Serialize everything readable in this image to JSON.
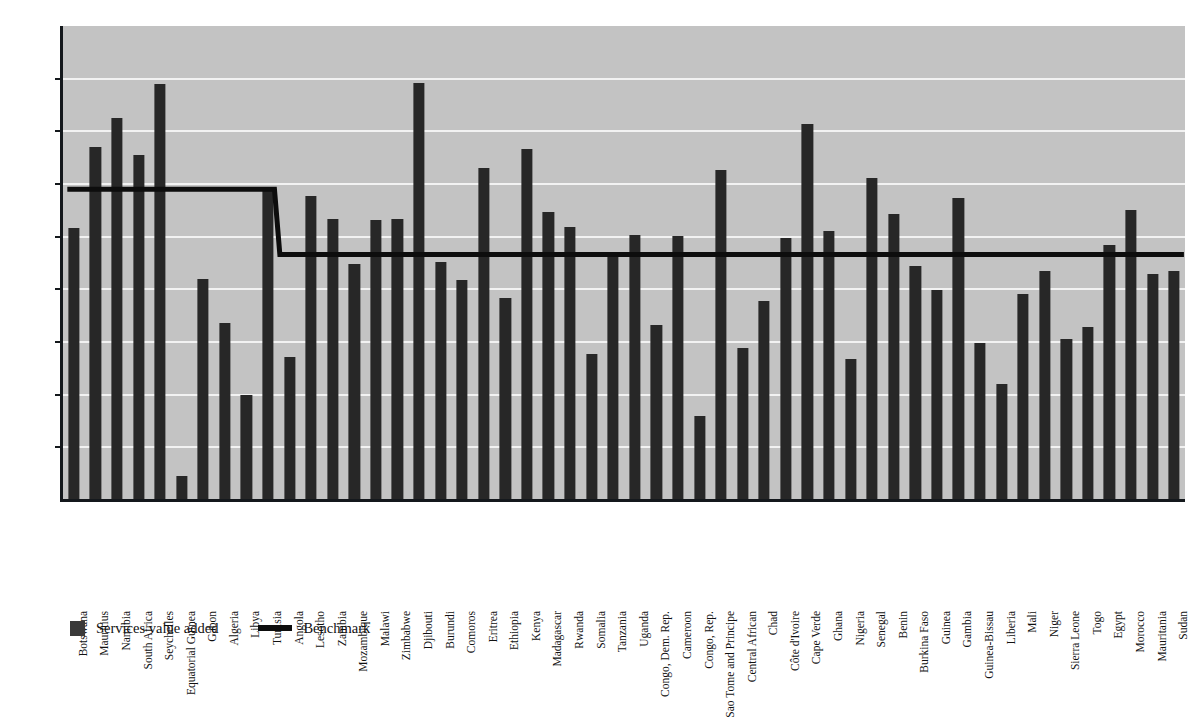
{
  "chart_data": {
    "type": "bar",
    "title": "",
    "subtitle": "",
    "xlabel": "",
    "ylabel": "",
    "ylim": [
      0,
      90
    ],
    "ytick_step": 10,
    "yticks": [
      0,
      10,
      20,
      30,
      40,
      50,
      60,
      70,
      80,
      90
    ],
    "grid": true,
    "legend_position": "bottom-left",
    "categories": [
      "Botswana",
      "Mauritius",
      "Namibia",
      "South Africa",
      "Seychelles",
      "Equatorial Guinea",
      "Gabon",
      "Algeria",
      "Libya",
      "Tunisia",
      "Angola",
      "Lesotho",
      "Zambia",
      "Mozambique",
      "Malawi",
      "Zimbabwe",
      "Djibouti",
      "Burundi",
      "Comoros",
      "Eritrea",
      "Ethiopia",
      "Kenya",
      "Madagascar",
      "Rwanda",
      "Somalia",
      "Tanzania",
      "Uganda",
      "Congo, Dem. Rep.",
      "Cameroon",
      "Congo, Rep.",
      "Sao Tome and Principe",
      "Central African",
      "Chad",
      "Côte d'Ivoire",
      "Cape Verde",
      "Ghana",
      "Nigeria",
      "Senegal",
      "Benin",
      "Burkina Faso",
      "Guinea",
      "Gambia",
      "Guinea-Bissau",
      "Liberia",
      "Mali",
      "Niger",
      "Sierra Leone",
      "Togo",
      "Egypt",
      "Morocco",
      "Mauritania",
      "Sudan"
    ],
    "series": [
      {
        "name": "Services value added",
        "type": "bar",
        "color": "#272727",
        "values": [
          51.6,
          67.0,
          72.6,
          65.5,
          79.0,
          4.5,
          42.0,
          33.7,
          19.9,
          59.0,
          27.2,
          57.7,
          53.4,
          44.8,
          53.2,
          53.3,
          79.2,
          45.2,
          41.7,
          63.0,
          38.3,
          66.7,
          54.7,
          51.8,
          27.8,
          47.0,
          50.4,
          33.2,
          50.1,
          16.0,
          62.6,
          28.9,
          37.7,
          49.8,
          71.4,
          51.0,
          26.8,
          61.1,
          54.3,
          44.5,
          39.8,
          57.4,
          29.8,
          22.1,
          39.2,
          43.4,
          30.5,
          32.8,
          48.5,
          55.1,
          43.0,
          43.4
        ]
      },
      {
        "name": "Benchmark",
        "type": "step-line",
        "color": "#0d0d0d",
        "segments": [
          {
            "from_category": "Botswana",
            "to_category": "Tunisia",
            "value": 59.0
          },
          {
            "from_category": "Angola",
            "to_category": "Sudan",
            "value": 46.6
          }
        ]
      }
    ]
  },
  "legend": {
    "items": [
      {
        "label": "Services value added",
        "marker": "square-swatch",
        "color": "#3a3a3a"
      },
      {
        "label": "Benchmark",
        "marker": "line-swatch",
        "color": "#0d0d0d"
      }
    ]
  },
  "axes": {
    "y": {
      "ticks": [
        "0",
        "10",
        "20",
        "30",
        "40",
        "50",
        "60",
        "70",
        "80",
        "90"
      ]
    }
  },
  "colors": {
    "plot_background": "#c3c3c3",
    "page_background": "#ffffff",
    "gridline": "#f2f2f2",
    "axis": "#14181c",
    "bar": "#272727",
    "benchmark": "#0d0d0d"
  }
}
